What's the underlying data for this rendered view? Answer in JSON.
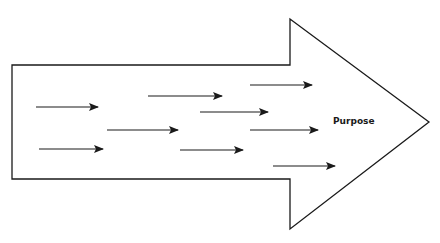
{
  "diagram": {
    "type": "big-arrow-with-aligned-arrows",
    "label": "Purpose",
    "colors": {
      "stroke": "#1a1a1a",
      "fill": "#ffffff"
    },
    "big_arrow": {
      "body": {
        "left": 12,
        "top": 65,
        "bottom": 179
      },
      "head": {
        "notch_x": 290,
        "top": 19,
        "bottom": 229,
        "tip_x": 429,
        "tip_y": 122
      }
    },
    "small_arrows": [
      {
        "x1": 36,
        "y": 107,
        "x2": 98
      },
      {
        "x1": 39,
        "y": 149,
        "x2": 103
      },
      {
        "x1": 107,
        "y": 130,
        "x2": 178
      },
      {
        "x1": 148,
        "y": 96,
        "x2": 222
      },
      {
        "x1": 200,
        "y": 112,
        "x2": 268
      },
      {
        "x1": 180,
        "y": 150,
        "x2": 243
      },
      {
        "x1": 250,
        "y": 85,
        "x2": 312
      },
      {
        "x1": 250,
        "y": 130,
        "x2": 318
      },
      {
        "x1": 273,
        "y": 166,
        "x2": 335
      }
    ]
  }
}
